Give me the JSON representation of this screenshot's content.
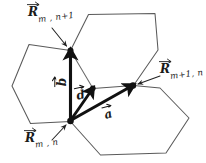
{
  "figure": {
    "background_color": "#ffffff",
    "line_color": "#555555",
    "vector_color": "#111111",
    "width": 206,
    "height": 163
  },
  "labels": {
    "r_top": {
      "base": "R",
      "subscript": "m , n+1",
      "icon": "vector-arrow-icon"
    },
    "r_right": {
      "base": "R",
      "subscript": "m+1, n",
      "icon": "vector-arrow-icon"
    },
    "r_origin": {
      "base": "R",
      "subscript": "m , n",
      "icon": "vector-arrow-icon"
    },
    "vec_b": {
      "letter": "b",
      "icon": "vector-arrow-icon"
    },
    "vec_d": {
      "letter": "d",
      "icon": "vector-arrow-icon"
    },
    "vec_a": {
      "letter": "a",
      "icon": "vector-arrow-icon"
    }
  },
  "geometry": {
    "nodes": {
      "origin": {
        "x": 70,
        "y": 121,
        "name": "R_m,n"
      },
      "top": {
        "x": 70,
        "y": 50,
        "name": "R_m,n+1"
      },
      "right": {
        "x": 133,
        "y": 85,
        "name": "R_m+1,n"
      },
      "d_end": {
        "x": 93,
        "y": 88,
        "name": "basis-point"
      }
    },
    "vectors": [
      {
        "name": "b",
        "from": "origin",
        "to": "top"
      },
      {
        "name": "d",
        "from": "origin",
        "to": "d_end"
      },
      {
        "name": "a",
        "from": "origin",
        "to": "right"
      }
    ],
    "hexagons": [
      {
        "name": "hex-left",
        "center": [
          42,
          85
        ]
      },
      {
        "name": "hex-upper-right",
        "center": [
          112,
          50
        ]
      },
      {
        "name": "hex-lower-right",
        "center": [
          112,
          121
        ]
      }
    ]
  }
}
